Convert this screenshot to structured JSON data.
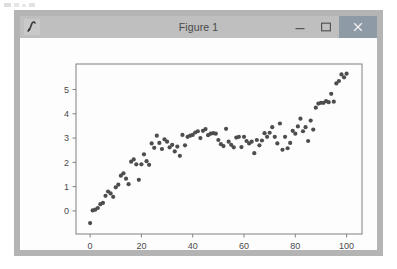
{
  "window": {
    "title": "Figure 1",
    "icon": "matplotlib-figure-icon",
    "buttons": [
      {
        "name": "minimize",
        "glyph": "minimize-icon"
      },
      {
        "name": "maximize",
        "glyph": "maximize-icon"
      },
      {
        "name": "close",
        "glyph": "close-icon"
      }
    ],
    "close_button_color": "#8e9aa6",
    "frame_color": "#b4b4b4",
    "titlebar_color": "#bfbfbf"
  },
  "chart_data": {
    "type": "scatter",
    "title": "",
    "xlabel": "",
    "ylabel": "",
    "xlim": [
      -5.5,
      106
    ],
    "ylim": [
      -0.95,
      6.05
    ],
    "xticks": [
      0,
      20,
      40,
      60,
      80,
      100
    ],
    "yticks": [
      0,
      1,
      2,
      3,
      4,
      5
    ],
    "grid": false,
    "legend": null,
    "marker_color": "#4d4d4d",
    "marker_size": 2.1,
    "axes_color": "#808080",
    "x": [
      0,
      1,
      2,
      3,
      4,
      5,
      6,
      7,
      8,
      9,
      10,
      11,
      12,
      13,
      14,
      15,
      16,
      17,
      18,
      19,
      20,
      21,
      22,
      23,
      24,
      25,
      26,
      27,
      28,
      29,
      30,
      31,
      32,
      33,
      34,
      35,
      36,
      37,
      38,
      39,
      40,
      41,
      42,
      43,
      44,
      45,
      46,
      47,
      48,
      49,
      50,
      51,
      52,
      53,
      54,
      55,
      56,
      57,
      58,
      59,
      60,
      61,
      62,
      63,
      64,
      65,
      66,
      67,
      68,
      69,
      70,
      71,
      72,
      73,
      74,
      75,
      76,
      77,
      78,
      79,
      80,
      81,
      82,
      83,
      84,
      85,
      86,
      87,
      88,
      89,
      90,
      91,
      92,
      93,
      94,
      95,
      96,
      97,
      98,
      99,
      100
    ],
    "y": [
      -0.5,
      0.02,
      0.05,
      0.12,
      0.28,
      0.33,
      0.62,
      0.8,
      0.72,
      0.58,
      0.97,
      1.08,
      1.45,
      1.55,
      1.33,
      1.1,
      2.03,
      2.12,
      1.92,
      1.28,
      1.92,
      2.33,
      2.05,
      1.9,
      2.78,
      2.6,
      3.1,
      2.8,
      2.55,
      2.95,
      2.85,
      2.62,
      2.72,
      2.45,
      2.65,
      2.27,
      3.13,
      2.7,
      3.05,
      3.1,
      3.13,
      3.23,
      3.28,
      3.0,
      3.3,
      3.37,
      3.12,
      3.18,
      3.2,
      3.18,
      2.92,
      2.75,
      2.67,
      3.38,
      2.85,
      2.72,
      2.62,
      3.02,
      3.05,
      2.63,
      3.05,
      2.88,
      2.78,
      2.85,
      2.38,
      2.92,
      2.7,
      2.9,
      3.2,
      3.05,
      3.22,
      3.45,
      3.05,
      2.78,
      3.6,
      2.52,
      3.05,
      2.58,
      2.8,
      3.3,
      3.18,
      3.48,
      3.8,
      3.28,
      3.45,
      2.88,
      3.72,
      3.35,
      4.25,
      4.42,
      4.45,
      4.45,
      4.52,
      4.48,
      4.82,
      4.5,
      5.25,
      5.35,
      5.62,
      5.5,
      5.65
    ]
  }
}
